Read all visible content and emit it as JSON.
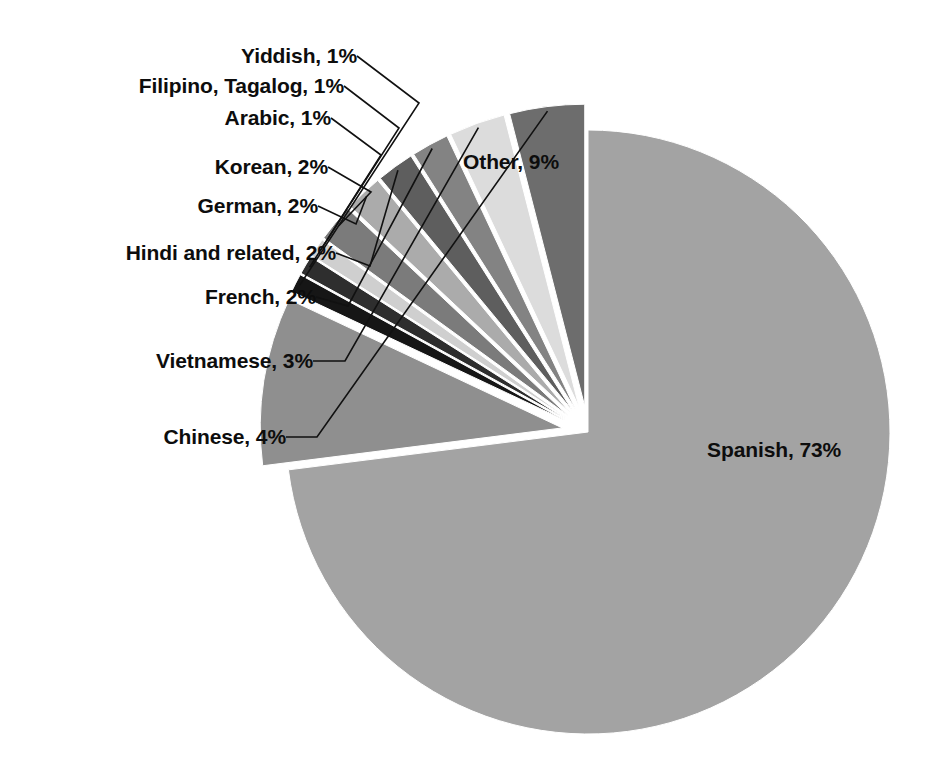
{
  "chart_data": {
    "type": "pie",
    "title": "",
    "subtitle": "",
    "xlabel": "",
    "ylabel": "",
    "legend_position": "none",
    "grid": false,
    "units": "percent",
    "categories": [
      "Spanish",
      "Other",
      "Yiddish",
      "Filipino, Tagalog",
      "Arabic",
      "Korean",
      "German",
      "Hindi and related",
      "French",
      "Vietnamese",
      "Chinese"
    ],
    "values": [
      73,
      9,
      1,
      1,
      1,
      2,
      2,
      2,
      2,
      3,
      4
    ],
    "data_labels": [
      "Spanish, 73%",
      "Other, 9%",
      "Yiddish, 1%",
      "Filipino, Tagalog, 1%",
      "Arabic, 1%",
      "Korean, 2%",
      "German, 2%",
      "Hindi and related, 2%",
      "French, 2%",
      "Vietnamese, 3%",
      "Chinese, 4%"
    ],
    "slice_colors": [
      "#a3a3a3",
      "#8f8f8f",
      "#161616",
      "#2e2e2e",
      "#cfcfcf",
      "#7b7b7b",
      "#ababab",
      "#5e5e5e",
      "#838383",
      "#dcdcdc",
      "#6d6d6d"
    ],
    "slices": [
      {
        "label": "Spanish, 73%",
        "name": "Spanish",
        "value": 73,
        "color": "#a3a3a3",
        "exploded": false,
        "label_placement": "inside"
      },
      {
        "label": "Other, 9%",
        "name": "Other",
        "value": 9,
        "color": "#8f8f8f",
        "exploded": true,
        "label_placement": "inside"
      },
      {
        "label": "Yiddish, 1%",
        "name": "Yiddish",
        "value": 1,
        "color": "#161616",
        "exploded": true,
        "label_placement": "leader-left"
      },
      {
        "label": "Filipino, Tagalog, 1%",
        "name": "Filipino, Tagalog",
        "value": 1,
        "color": "#2e2e2e",
        "exploded": true,
        "label_placement": "leader-left"
      },
      {
        "label": "Arabic, 1%",
        "name": "Arabic",
        "value": 1,
        "color": "#cfcfcf",
        "exploded": true,
        "label_placement": "leader-left"
      },
      {
        "label": "Korean, 2%",
        "name": "Korean",
        "value": 2,
        "color": "#7b7b7b",
        "exploded": true,
        "label_placement": "leader-left"
      },
      {
        "label": "German, 2%",
        "name": "German",
        "value": 2,
        "color": "#ababab",
        "exploded": true,
        "label_placement": "leader-left"
      },
      {
        "label": "Hindi and related, 2%",
        "name": "Hindi and related",
        "value": 2,
        "color": "#5e5e5e",
        "exploded": true,
        "label_placement": "leader-left"
      },
      {
        "label": "French, 2%",
        "name": "French",
        "value": 2,
        "color": "#838383",
        "exploded": true,
        "label_placement": "leader-left"
      },
      {
        "label": "Vietnamese, 3%",
        "name": "Vietnamese",
        "value": 3,
        "color": "#dcdcdc",
        "exploded": true,
        "label_placement": "leader-left"
      },
      {
        "label": "Chinese, 4%",
        "name": "Chinese",
        "value": 4,
        "color": "#6d6d6d",
        "exploded": true,
        "label_placement": "leader-left"
      }
    ],
    "total": 100,
    "background_color": "#ffffff",
    "label_text_color": "#0d0d0d",
    "slice_gap_color": "#ffffff"
  }
}
